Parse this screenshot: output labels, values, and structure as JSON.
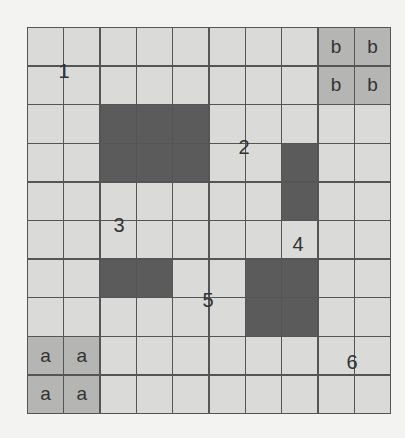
{
  "grid": {
    "rows": 10,
    "cols": 10,
    "colors": {
      "empty": "#dadad8",
      "blocked": "#5b5b5b",
      "shaded": "#b5b5b3",
      "line": "#555555"
    },
    "blocked_cells": [
      [
        2,
        2
      ],
      [
        2,
        3
      ],
      [
        2,
        4
      ],
      [
        3,
        2
      ],
      [
        3,
        3
      ],
      [
        3,
        4
      ],
      [
        3,
        7
      ],
      [
        4,
        7
      ],
      [
        6,
        2
      ],
      [
        6,
        3
      ],
      [
        6,
        6
      ],
      [
        6,
        7
      ],
      [
        7,
        6
      ],
      [
        7,
        7
      ]
    ],
    "lettered_cells": [
      {
        "row": 0,
        "col": 8,
        "text": "b"
      },
      {
        "row": 0,
        "col": 9,
        "text": "b"
      },
      {
        "row": 1,
        "col": 8,
        "text": "b"
      },
      {
        "row": 1,
        "col": 9,
        "text": "b"
      },
      {
        "row": 8,
        "col": 0,
        "text": "a"
      },
      {
        "row": 8,
        "col": 1,
        "text": "a"
      },
      {
        "row": 9,
        "col": 0,
        "text": "a"
      },
      {
        "row": 9,
        "col": 1,
        "text": "a"
      }
    ]
  },
  "region_labels": [
    {
      "text": "1",
      "x": 64,
      "y": 71
    },
    {
      "text": "2",
      "x": 244,
      "y": 147
    },
    {
      "text": "3",
      "x": 119,
      "y": 225
    },
    {
      "text": "4",
      "x": 298,
      "y": 244
    },
    {
      "text": "5",
      "x": 208,
      "y": 300
    },
    {
      "text": "6",
      "x": 352,
      "y": 362
    }
  ]
}
